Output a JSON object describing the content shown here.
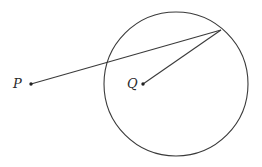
{
  "diagram": {
    "type": "geometry",
    "colors": {
      "stroke": "#3a3a3a",
      "point": "#222222",
      "label": "#2a2a2a",
      "background": "#ffffff"
    },
    "circle": {
      "cx": 176,
      "cy": 84,
      "r": 72
    },
    "points": [
      {
        "id": "P",
        "label": "P",
        "x": 31,
        "y": 84
      },
      {
        "id": "Q",
        "label": "Q",
        "x": 143,
        "y": 84
      },
      {
        "id": "T",
        "label": "",
        "x": 221,
        "y": 30
      }
    ],
    "segments": [
      {
        "from": "P",
        "to": "T"
      },
      {
        "from": "Q",
        "to": "T"
      }
    ]
  }
}
